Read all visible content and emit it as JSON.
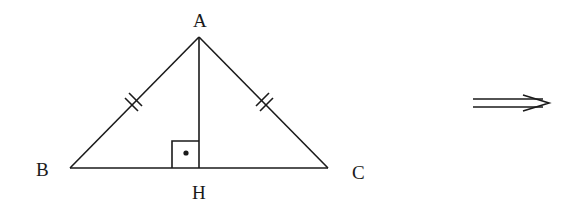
{
  "figure": {
    "type": "isosceles-triangle-with-altitude",
    "vertices": {
      "A": {
        "label": "A"
      },
      "B": {
        "label": "B"
      },
      "C": {
        "label": "C"
      },
      "H": {
        "label": "H"
      }
    },
    "marks": {
      "equal_sides": [
        "AB",
        "AC"
      ],
      "tick_count": 2,
      "right_angle_at": "H"
    },
    "arrow": {
      "symbol": "implies",
      "glyph": "⟹"
    },
    "colors": {
      "stroke": "#1a1a1a",
      "background": "#ffffff"
    }
  }
}
